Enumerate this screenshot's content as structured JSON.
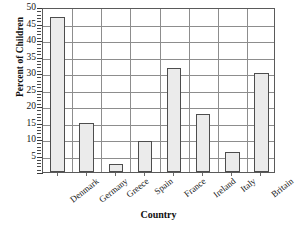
{
  "chart_data": {
    "type": "bar",
    "title": "",
    "xlabel": "Country",
    "ylabel": "Percent of Children",
    "categories": [
      "Denmark",
      "Germany",
      "Greece",
      "Spain",
      "France",
      "Ireland",
      "Italy",
      "Britain"
    ],
    "values": [
      47,
      15,
      2.5,
      9.5,
      31.5,
      17.5,
      6,
      30
    ],
    "ylim": [
      0,
      50
    ],
    "ytick_labels": [
      "50",
      "45",
      "40",
      "35",
      "30",
      "25",
      "20",
      "15",
      "10",
      "5"
    ],
    "ytick_values": [
      50,
      45,
      40,
      35,
      30,
      25,
      20,
      15,
      10,
      5
    ],
    "ytick_step": 5,
    "minor_tick_step": 1,
    "grid": "horizontal-and-vertical",
    "legend": "none",
    "bar_fill_color": "#ebebeb",
    "bar_edge_color": "#4d4d4d",
    "grid_color": "#8d8d8d",
    "frame_color": "#5a5a5a",
    "text_color": "#151515",
    "background_color": "#ffffff"
  }
}
